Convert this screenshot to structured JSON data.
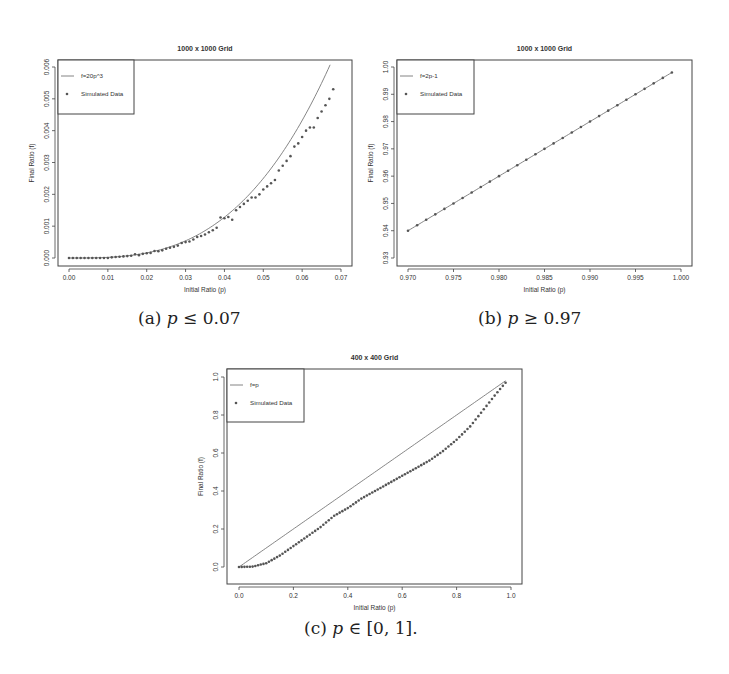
{
  "figure": {
    "captions": {
      "a": {
        "label": "(a)",
        "math": "p",
        "rel": " ≤ 0.07"
      },
      "b": {
        "label": "(b)",
        "math": "p",
        "rel": " ≥ 0.97"
      },
      "c": {
        "label": "(c)",
        "math": "p",
        "rel": " ∈ [0, 1]."
      }
    }
  },
  "chart_data": [
    {
      "id": "a",
      "type": "scatter",
      "title": "1000 x 1000 Grid",
      "xlabel": "Initial Ratio (p)",
      "ylabel": "Final Ratio (f)",
      "xlim": [
        0.0,
        0.07
      ],
      "ylim": [
        0.0,
        0.006
      ],
      "xticks": [
        "0.00",
        "0.01",
        "0.02",
        "0.03",
        "0.04",
        "0.05",
        "0.06",
        "0.07"
      ],
      "yticks": [
        "0.000",
        "0.001",
        "0.002",
        "0.003",
        "0.004",
        "0.005",
        "0.006"
      ],
      "grid": false,
      "legend": {
        "position": "top-left",
        "entries": [
          {
            "label": "f=20p^3",
            "kind": "line"
          },
          {
            "label": "Simulated Data",
            "kind": "point"
          }
        ]
      },
      "series": [
        {
          "name": "f=20p^3",
          "kind": "line",
          "function": "20*p^3",
          "x_range": [
            0.0,
            0.0672
          ]
        },
        {
          "name": "Simulated Data",
          "kind": "points",
          "x": [
            0.0,
            0.001,
            0.002,
            0.003,
            0.004,
            0.005,
            0.006,
            0.007,
            0.008,
            0.009,
            0.01,
            0.011,
            0.012,
            0.013,
            0.014,
            0.015,
            0.016,
            0.017,
            0.018,
            0.019,
            0.02,
            0.021,
            0.022,
            0.023,
            0.024,
            0.025,
            0.026,
            0.027,
            0.028,
            0.029,
            0.03,
            0.031,
            0.032,
            0.033,
            0.034,
            0.035,
            0.036,
            0.037,
            0.038,
            0.039,
            0.04,
            0.041,
            0.042,
            0.043,
            0.044,
            0.045,
            0.046,
            0.047,
            0.048,
            0.049,
            0.05,
            0.051,
            0.052,
            0.053,
            0.054,
            0.055,
            0.056,
            0.057,
            0.058,
            0.059,
            0.06,
            0.061,
            0.062,
            0.063,
            0.064,
            0.065,
            0.066,
            0.067,
            0.068
          ],
          "y": [
            0.0,
            0.0,
            0.0,
            0.0,
            0.0,
            0.0,
            0.0,
            0.0,
            0.0,
            0.0,
            0.0,
            2e-05,
            3e-05,
            4e-05,
            5e-05,
            6e-05,
            7e-05,
            0.00012,
            9e-05,
            0.00013,
            0.00015,
            0.00016,
            0.00022,
            0.00021,
            0.00024,
            0.00029,
            0.00032,
            0.00035,
            0.00039,
            0.00047,
            0.0005,
            0.00052,
            0.00058,
            0.00066,
            0.00069,
            0.00074,
            0.00081,
            0.00087,
            0.00095,
            0.00127,
            0.00125,
            0.00129,
            0.0012,
            0.0015,
            0.0016,
            0.0017,
            0.0018,
            0.0019,
            0.0019,
            0.002,
            0.00215,
            0.00225,
            0.00235,
            0.00245,
            0.00275,
            0.0029,
            0.00305,
            0.0032,
            0.0035,
            0.0036,
            0.0038,
            0.004,
            0.0041,
            0.0041,
            0.0044,
            0.0046,
            0.0048,
            0.005,
            0.0053
          ]
        }
      ]
    },
    {
      "id": "b",
      "type": "scatter",
      "title": "1000 x 1000 Grid",
      "xlabel": "Initial Ratio (p)",
      "ylabel": "Final Ratio (f)",
      "xlim": [
        0.97,
        1.0
      ],
      "ylim": [
        0.93,
        1.0
      ],
      "xticks": [
        "0.970",
        "0.975",
        "0.980",
        "0.985",
        "0.990",
        "0.995",
        "1.000"
      ],
      "yticks": [
        "0.93",
        "0.94",
        "0.95",
        "0.96",
        "0.97",
        "0.98",
        "0.99",
        "1.00"
      ],
      "grid": false,
      "legend": {
        "position": "top-left",
        "entries": [
          {
            "label": "f=2p-1",
            "kind": "line"
          },
          {
            "label": "Simulated Data",
            "kind": "point"
          }
        ]
      },
      "series": [
        {
          "name": "f=2p-1",
          "kind": "line",
          "function": "2*p-1",
          "x_range": [
            0.97,
            0.999
          ]
        },
        {
          "name": "Simulated Data",
          "kind": "points",
          "x": [
            0.97,
            0.971,
            0.972,
            0.973,
            0.974,
            0.975,
            0.976,
            0.977,
            0.978,
            0.979,
            0.98,
            0.981,
            0.982,
            0.983,
            0.984,
            0.985,
            0.986,
            0.987,
            0.988,
            0.989,
            0.99,
            0.991,
            0.992,
            0.993,
            0.994,
            0.995,
            0.996,
            0.997,
            0.998,
            0.999
          ],
          "y": [
            0.94,
            0.942,
            0.944,
            0.946,
            0.948,
            0.95,
            0.952,
            0.954,
            0.956,
            0.958,
            0.96,
            0.962,
            0.964,
            0.966,
            0.968,
            0.97,
            0.972,
            0.974,
            0.976,
            0.978,
            0.98,
            0.982,
            0.984,
            0.986,
            0.988,
            0.99,
            0.992,
            0.994,
            0.996,
            0.998
          ]
        }
      ]
    },
    {
      "id": "c",
      "type": "scatter",
      "title": "400 x 400 Grid",
      "xlabel": "Initial Ratio (p)",
      "ylabel": "Final Ratio (f)",
      "xlim": [
        0.0,
        1.0
      ],
      "ylim": [
        0.0,
        1.0
      ],
      "xticks": [
        "0.0",
        "0.2",
        "0.4",
        "0.6",
        "0.8",
        "1.0"
      ],
      "yticks": [
        "0.0",
        "0.2",
        "0.4",
        "0.6",
        "0.8",
        "1.0"
      ],
      "grid": false,
      "legend": {
        "position": "top-left",
        "entries": [
          {
            "label": "f=p",
            "kind": "line"
          },
          {
            "label": "Simulated Data",
            "kind": "point"
          }
        ]
      },
      "series": [
        {
          "name": "f=p",
          "kind": "line",
          "function": "p",
          "x_range": [
            0.0,
            0.98
          ]
        },
        {
          "name": "Simulated Data",
          "kind": "points",
          "n": 99,
          "x_range": [
            0.0,
            0.98
          ],
          "shape": "sigmoid-like, below f=p; near 0 until p≈0.08, ~0.2 at p=0.25, ~0.38 at p=0.45, ~0.5 at p=0.6, ~0.62 at p=0.75, ~0.8 at p=0.88, ~0.97 at p=0.98",
          "key_points": [
            [
              0.0,
              0.0
            ],
            [
              0.05,
              0.002
            ],
            [
              0.1,
              0.02
            ],
            [
              0.15,
              0.06
            ],
            [
              0.2,
              0.11
            ],
            [
              0.25,
              0.16
            ],
            [
              0.3,
              0.21
            ],
            [
              0.35,
              0.27
            ],
            [
              0.4,
              0.31
            ],
            [
              0.45,
              0.36
            ],
            [
              0.5,
              0.4
            ],
            [
              0.55,
              0.44
            ],
            [
              0.6,
              0.48
            ],
            [
              0.65,
              0.52
            ],
            [
              0.7,
              0.56
            ],
            [
              0.75,
              0.61
            ],
            [
              0.8,
              0.67
            ],
            [
              0.85,
              0.74
            ],
            [
              0.9,
              0.83
            ],
            [
              0.95,
              0.92
            ],
            [
              0.98,
              0.97
            ]
          ]
        }
      ]
    }
  ]
}
